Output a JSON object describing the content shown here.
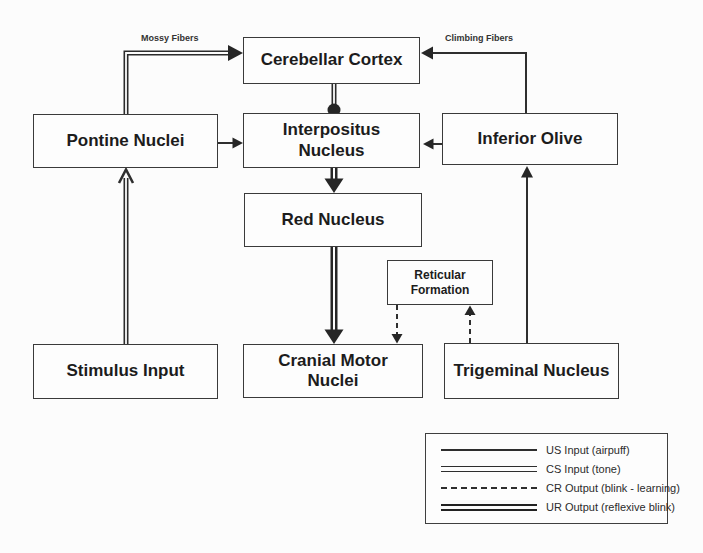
{
  "diagram": {
    "nodes": {
      "cerebellar_cortex": {
        "label": "Cerebellar Cortex"
      },
      "pontine_nuclei": {
        "label": "Pontine Nuclei"
      },
      "interpositus_nucleus": {
        "label": "Interpositus\nNucleus"
      },
      "inferior_olive": {
        "label": "Inferior Olive"
      },
      "red_nucleus": {
        "label": "Red Nucleus"
      },
      "reticular_formation": {
        "label": "Reticular\nFormation"
      },
      "stimulus_input": {
        "label": "Stimulus Input"
      },
      "cranial_motor_nuclei": {
        "label": "Cranial Motor\nNuclei"
      },
      "trigeminal_nucleus": {
        "label": "Trigeminal Nucleus"
      }
    },
    "edge_labels": {
      "mossy_fibers": "Mossy Fibers",
      "climbing_fibers": "Climbing Fibers"
    },
    "legend": {
      "items": [
        {
          "style": "us-single-line",
          "label": "US Input (airpuff)"
        },
        {
          "style": "cs-double-line",
          "label": "CS Input (tone)"
        },
        {
          "style": "cr-dashed-line",
          "label": "CR Output (blink - learning)"
        },
        {
          "style": "ur-thick-double-line",
          "label": "UR Output (reflexive blink)"
        }
      ]
    },
    "colors": {
      "line": "#2f2f2f",
      "text": "#1c1c1c",
      "background": "#fcfcfc"
    }
  }
}
